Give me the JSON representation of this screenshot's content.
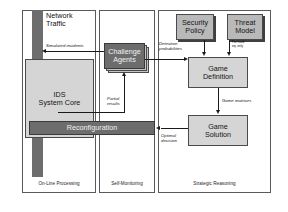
{
  "diagram": {
    "panels": [
      {
        "id": "online",
        "label": "On-Line Processing"
      },
      {
        "id": "selfmon",
        "label": "Self-Monitoring"
      },
      {
        "id": "strategic",
        "label": "Strategic Reasoning"
      }
    ],
    "nodes": [
      {
        "id": "network_traffic",
        "label": "Network\nTraffic",
        "style": "free-text"
      },
      {
        "id": "ids_core",
        "label": "IDS\nSystem Core",
        "style": "box-lite"
      },
      {
        "id": "reconfiguration",
        "label": "Reconfiguration",
        "style": "box-dark"
      },
      {
        "id": "challenge_agents",
        "label": "Challenge\nAgents",
        "style": "stacked"
      },
      {
        "id": "security_policy",
        "label": "Security\nPolicy",
        "style": "box-mid"
      },
      {
        "id": "threat_model",
        "label": "Threat\nModel",
        "style": "box-mid"
      },
      {
        "id": "game_definition",
        "label": "Game\nDefinition",
        "style": "box-lite"
      },
      {
        "id": "game_solution",
        "label": "Game\nSolution",
        "style": "box-lite"
      }
    ],
    "edges": [
      {
        "id": "simulated_incidents",
        "label": "Simulated incidents",
        "from": "challenge_agents",
        "to": "network_traffic"
      },
      {
        "id": "detection_probabilities",
        "label": "Detection\nprobabilities",
        "from": "challenge_agents",
        "to": "game_definition"
      },
      {
        "id": "partial_results",
        "label": "Partial\nresults",
        "from": "ids_core",
        "to": "challenge_agents"
      },
      {
        "id": "game_matrices",
        "label": "Game matrices",
        "from": "game_definition",
        "to": "game_solution"
      },
      {
        "id": "optimal_decision",
        "label": "Optimal\ndecision",
        "from": "game_solution",
        "to": "reconfiguration"
      },
      {
        "id": "threat_model_note",
        "label": "For fixed\neq. only",
        "from": "threat_model",
        "to": "game_definition"
      }
    ],
    "colors": {
      "panel_border": "#5a5a5a",
      "box_border": "#4a4a4a",
      "fill_light": "#d5d5d5",
      "fill_mid": "#b9b9b9",
      "fill_dark": "#6d6d6d",
      "line": "#1a1a1a",
      "background": "#ffffff"
    }
  }
}
